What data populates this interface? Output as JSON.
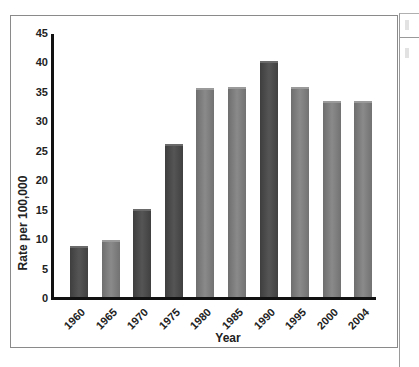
{
  "chart_data": {
    "type": "bar",
    "title": "",
    "xlabel": "Year",
    "ylabel": "Rate per 100,000",
    "ylim": [
      0,
      45
    ],
    "yticks": [
      0,
      5,
      10,
      15,
      20,
      25,
      30,
      35,
      40,
      45
    ],
    "grid": false,
    "legend": null,
    "categories": [
      "1960",
      "1965",
      "1970",
      "1975",
      "1980",
      "1985",
      "1990",
      "1995",
      "2000",
      "2004"
    ],
    "values": [
      8.8,
      9.8,
      15.1,
      26.1,
      35.7,
      35.9,
      40.3,
      35.9,
      33.5,
      33.5
    ],
    "bar_shades": [
      "dark",
      "light",
      "dark",
      "dark",
      "light",
      "light",
      "dark",
      "light",
      "light",
      "light"
    ],
    "colors": {
      "dark": "#4a4a4a",
      "light": "#7c7c7c",
      "axis": "#111111"
    }
  }
}
